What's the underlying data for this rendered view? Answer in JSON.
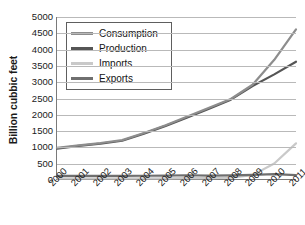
{
  "chart_data": {
    "type": "line",
    "title": "",
    "xlabel": "",
    "ylabel": "Billion cubbic feet",
    "x": [
      "2000",
      "2001",
      "2002",
      "2003",
      "2004",
      "2005",
      "2006",
      "2007",
      "2008",
      "2009",
      "2010",
      "2011"
    ],
    "categories": [
      "2000",
      "2001",
      "2002",
      "2003",
      "2004",
      "2005",
      "2006",
      "2007",
      "2008",
      "2009",
      "2010",
      "2011"
    ],
    "ylim": [
      0,
      5000
    ],
    "xlim_labels": [
      "2000",
      "2011"
    ],
    "yticks": [
      0,
      500,
      1000,
      1500,
      2000,
      2500,
      3000,
      3500,
      4000,
      4500,
      5000
    ],
    "ytick_labels": [
      "0",
      "500",
      "1000",
      "1500",
      "2000",
      "2500",
      "3000",
      "3500",
      "4000",
      "4500",
      "5000"
    ],
    "grid": "horizontal",
    "legend_position": "upper-left-inside",
    "series": [
      {
        "name": "Consumption",
        "color": "#8d8d8d",
        "values": [
          960,
          1040,
          1110,
          1200,
          1420,
          1660,
          1930,
          2200,
          2470,
          2910,
          3680,
          4620
        ]
      },
      {
        "name": "Production",
        "color": "#555555",
        "values": [
          940,
          1020,
          1090,
          1180,
          1400,
          1640,
          1900,
          2170,
          2450,
          2870,
          3230,
          3620
        ]
      },
      {
        "name": "Imports",
        "color": "#c9c9c9",
        "values": [
          20,
          20,
          20,
          20,
          20,
          20,
          25,
          30,
          40,
          120,
          480,
          1100
        ]
      },
      {
        "name": "Exports",
        "color": "#6f6f6f",
        "values": [
          95,
          95,
          95,
          95,
          100,
          105,
          115,
          105,
          110,
          130,
          150,
          120
        ]
      }
    ]
  },
  "legend": {
    "items": [
      {
        "label": "Consumption"
      },
      {
        "label": "Production"
      },
      {
        "label": "Imports"
      },
      {
        "label": "Exports"
      }
    ]
  },
  "axes": {
    "y_title": "Billion cubbic feet"
  },
  "colors": {
    "gridline": "#b9b9b9",
    "axis": "#7a7a7a",
    "text": "#1a1a1a",
    "legend_border": "#5e5e5e",
    "background": "#ffffff"
  }
}
